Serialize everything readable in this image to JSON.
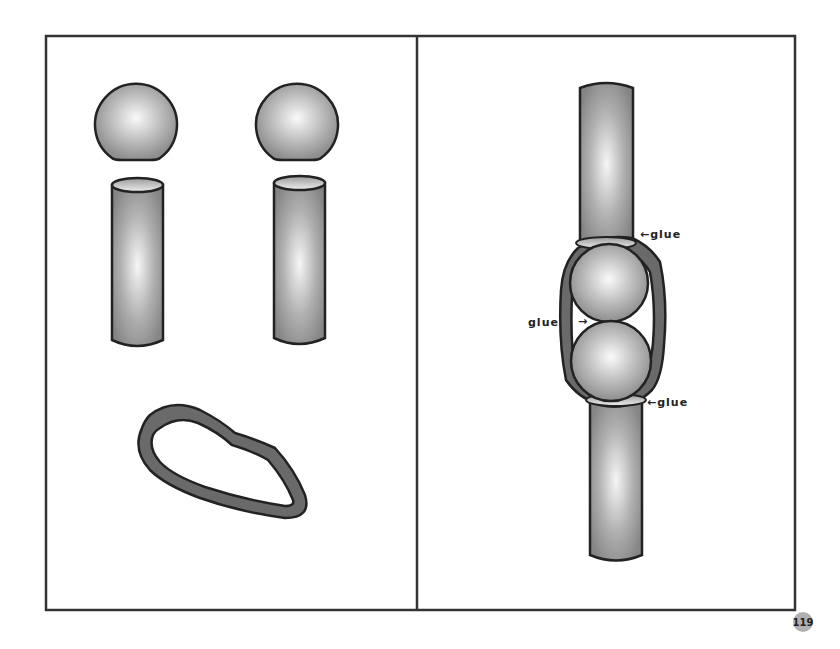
{
  "page": {
    "page_number": "119"
  },
  "left_panel": {
    "description": "Parts: two ball pieces, two tube pieces, one band loop",
    "parts": [
      {
        "type": "ball",
        "name": "ball-1"
      },
      {
        "type": "ball",
        "name": "ball-2"
      },
      {
        "type": "tube",
        "name": "tube-1"
      },
      {
        "type": "tube",
        "name": "tube-2"
      },
      {
        "type": "band",
        "name": "band-loop"
      }
    ]
  },
  "right_panel": {
    "description": "Assembly: tube, two balls, tube wrapped with band",
    "annotations": [
      {
        "text": "glue",
        "arrow": "←",
        "position": "upper-right"
      },
      {
        "text": "glue",
        "arrow": "→",
        "position": "middle-left"
      },
      {
        "text": "glue",
        "arrow": "←",
        "position": "lower-right"
      }
    ]
  },
  "colors": {
    "outline": "#222222",
    "band": "#666666",
    "page_badge": "#b0b0b0",
    "shade_light": "#f4f4f4",
    "shade_dark": "#8a8a8a"
  }
}
